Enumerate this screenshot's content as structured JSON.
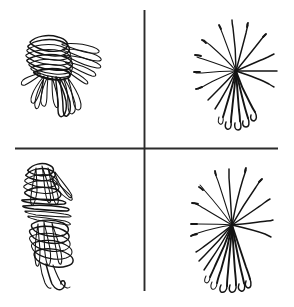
{
  "figure": {
    "title": "",
    "background_color": "#ffffff",
    "ink_color": "#141414",
    "divider_color": "#2b2b2b",
    "width": 294,
    "height": 307,
    "layout": "2x2 panel grid separated by a horizontal and a vertical rule"
  },
  "dividers": {
    "vertical": {
      "x": 144.5,
      "y1": 10,
      "y2": 291,
      "label": "vertical-divider"
    },
    "horizontal": {
      "y": 148.5,
      "x1": 15,
      "x2": 278,
      "label": "horizontal-divider"
    }
  },
  "panels": [
    {
      "id": "top-left",
      "name": "panel-top-left",
      "label": "",
      "pattern": "confined-tangled-tracks",
      "description": "Dense overlapping looping trajectories confined to a narrow region",
      "bbox": [
        18,
        33,
        62,
        85
      ],
      "track_count": 22
    },
    {
      "id": "top-right",
      "name": "panel-top-right",
      "label": "",
      "pattern": "radial-dispersed-tracks",
      "description": "Curved trajectories radiating outward from a common origin",
      "bbox": [
        190,
        20,
        75,
        110
      ],
      "track_count": 24,
      "origin": [
        236,
        71
      ]
    },
    {
      "id": "bottom-left",
      "name": "panel-bottom-left",
      "label": "",
      "pattern": "confined-tangled-tracks",
      "description": "Dense overlapping looping trajectories in an elongated vertical cluster",
      "bbox": [
        18,
        160,
        60,
        130
      ],
      "track_count": 26
    },
    {
      "id": "bottom-right",
      "name": "panel-bottom-right",
      "label": "",
      "pattern": "radial-dispersed-tracks",
      "description": "Curved trajectories radiating outward from a common origin, longer reach",
      "bbox": [
        186,
        168,
        84,
        122
      ],
      "track_count": 26,
      "origin": [
        232,
        225
      ]
    }
  ],
  "chart_data": {
    "type": "scatter",
    "title": "",
    "xlabel": "",
    "ylabel": "",
    "grid": false,
    "legend": null,
    "note": "Four-panel cell migration / particle trajectory plot. Left column: confined, highly tortuous tracks. Right column: radially dispersive, nearly straight tracks emanating from a common origin.",
    "panels": [
      {
        "panel": "top-left",
        "track_count": 22,
        "mode": "confined"
      },
      {
        "panel": "top-right",
        "track_count": 24,
        "mode": "radial"
      },
      {
        "panel": "bottom-left",
        "track_count": 26,
        "mode": "confined"
      },
      {
        "panel": "bottom-right",
        "track_count": 26,
        "mode": "radial"
      }
    ]
  }
}
